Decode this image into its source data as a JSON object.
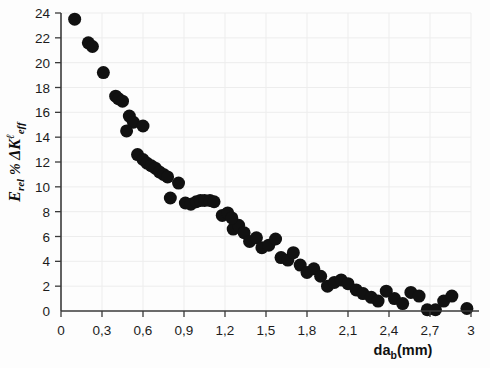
{
  "chart_data": {
    "type": "scatter",
    "title": "",
    "xlabel": "da_b(mm)",
    "ylabel": "E_rel % ΔK^ℓ_eff",
    "xlim": [
      0,
      3
    ],
    "ylim": [
      0,
      24
    ],
    "xticks": [
      0,
      0.3,
      0.6,
      0.9,
      1.2,
      1.5,
      1.8,
      2.1,
      2.4,
      2.7,
      3
    ],
    "xtick_labels": [
      "0",
      "0,3",
      "0,6",
      "0,9",
      "1,2",
      "1,5",
      "1,8",
      "2,1",
      "2,4",
      "2,7",
      "3"
    ],
    "yticks": [
      0,
      2,
      4,
      6,
      8,
      10,
      12,
      14,
      16,
      18,
      20,
      22,
      24
    ],
    "ytick_labels": [
      "0",
      "2",
      "4",
      "6",
      "8",
      "10",
      "12",
      "14",
      "16",
      "18",
      "20",
      "22",
      "24"
    ],
    "grid": true,
    "legend": null,
    "marker": "filled-circle",
    "marker_color": "#111111",
    "marker_size": 11,
    "decimal_separator": ",",
    "x": [
      0.1,
      0.2,
      0.23,
      0.31,
      0.4,
      0.42,
      0.45,
      0.5,
      0.53,
      0.6,
      0.48,
      0.56,
      0.6,
      0.63,
      0.66,
      0.69,
      0.72,
      0.75,
      0.78,
      0.86,
      0.8,
      0.91,
      0.95,
      0.99,
      1.02,
      1.05,
      1.09,
      1.12,
      1.18,
      1.22,
      1.26,
      1.3,
      1.34,
      1.25,
      1.38,
      1.43,
      1.47,
      1.52,
      1.57,
      1.61,
      1.66,
      1.7,
      1.75,
      1.8,
      1.85,
      1.9,
      1.95,
      2.0,
      2.05,
      2.1,
      2.16,
      2.21,
      2.27,
      2.32,
      2.38,
      2.44,
      2.5,
      2.56,
      2.62,
      2.68,
      2.74,
      2.8,
      2.86,
      2.97
    ],
    "y": [
      23.5,
      21.6,
      21.3,
      19.2,
      17.3,
      17.1,
      16.9,
      15.7,
      15.2,
      14.9,
      14.5,
      12.6,
      12.2,
      11.9,
      11.7,
      11.5,
      11.2,
      11.0,
      10.8,
      10.3,
      9.1,
      8.7,
      8.6,
      8.8,
      8.9,
      8.9,
      8.9,
      8.8,
      7.7,
      7.9,
      6.6,
      6.9,
      6.3,
      7.5,
      5.6,
      5.9,
      5.1,
      5.3,
      5.8,
      4.3,
      4.1,
      4.7,
      3.7,
      3.1,
      3.4,
      2.8,
      2.0,
      2.3,
      2.5,
      2.2,
      1.7,
      1.4,
      1.1,
      0.8,
      1.6,
      1.0,
      0.6,
      1.5,
      1.2,
      0.1,
      0.1,
      0.8,
      1.2,
      0.2
    ]
  },
  "axes": {
    "x_axis_name": "da-b-mm-axis",
    "y_axis_name": "erel-delta-keff-axis"
  },
  "ylabel_parts": {
    "e": "E",
    "rel": "rel",
    "percent": "%",
    "delta_k": "ΔK",
    "sup": "ℓ",
    "sub": "eff"
  },
  "xlabel_parts": {
    "da": "da",
    "sub": "b",
    "unit": "(mm)"
  }
}
